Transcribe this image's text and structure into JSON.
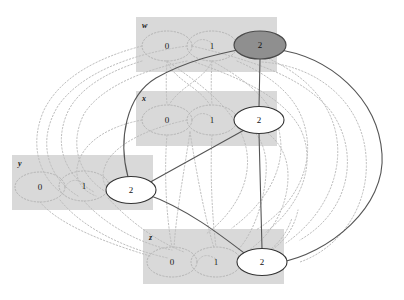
{
  "figure": {
    "type": "constraint-graph",
    "background": "#ffffff",
    "width": 404,
    "height": 300,
    "group_box_color": "#d9d9d9",
    "dotted_edge_color": "#b9b9b9",
    "solid_edge_color": "#555555",
    "node_fill": "#ffffff",
    "node_stroke": "#333333",
    "highlight_fill": "#8f8f8f",
    "highlight_stroke": "#4a4a4a"
  },
  "groups": [
    {
      "name": "w",
      "label": "w",
      "label_pos": {
        "x": 142,
        "y": 22
      },
      "box": {
        "x": 136,
        "y": 17,
        "w": 141,
        "h": 55
      },
      "values": [
        {
          "label": "0",
          "x": 167,
          "y": 46,
          "style": "dotted"
        },
        {
          "label": "1",
          "x": 212,
          "y": 46,
          "style": "dotted"
        },
        {
          "label": "2",
          "x": 260,
          "y": 45,
          "style": "solid",
          "highlighted": true
        }
      ]
    },
    {
      "name": "x",
      "label": "x",
      "label_pos": {
        "x": 142,
        "y": 95
      },
      "box": {
        "x": 136,
        "y": 91,
        "w": 141,
        "h": 55
      },
      "values": [
        {
          "label": "0",
          "x": 167,
          "y": 120,
          "style": "dotted"
        },
        {
          "label": "1",
          "x": 212,
          "y": 120,
          "style": "dotted"
        },
        {
          "label": "2",
          "x": 259,
          "y": 120,
          "style": "solid",
          "highlighted": false
        }
      ]
    },
    {
      "name": "y",
      "label": "y",
      "label_pos": {
        "x": 18,
        "y": 160
      },
      "box": {
        "x": 12,
        "y": 155,
        "w": 141,
        "h": 55
      },
      "values": [
        {
          "label": "0",
          "x": 40,
          "y": 187,
          "style": "dotted"
        },
        {
          "label": "1",
          "x": 84,
          "y": 186,
          "style": "dotted"
        },
        {
          "label": "2",
          "x": 131,
          "y": 190,
          "style": "solid",
          "highlighted": false
        }
      ]
    },
    {
      "name": "z",
      "label": "z",
      "label_pos": {
        "x": 149,
        "y": 234
      },
      "box": {
        "x": 143,
        "y": 229,
        "w": 141,
        "h": 55
      },
      "values": [
        {
          "label": "0",
          "x": 172,
          "y": 262,
          "style": "dotted"
        },
        {
          "label": "1",
          "x": 216,
          "y": 262,
          "style": "dotted"
        },
        {
          "label": "2",
          "x": 262,
          "y": 262,
          "style": "solid",
          "highlighted": false
        }
      ]
    }
  ],
  "solid_edges": [
    {
      "from": "w.2",
      "to": "x.2",
      "kind": "straight"
    },
    {
      "from": "x.2",
      "to": "z.2",
      "kind": "straight"
    },
    {
      "from": "x.2",
      "to": "y.2",
      "kind": "straight"
    },
    {
      "from": "y.2",
      "to": "w.2",
      "kind": "curve-left"
    },
    {
      "from": "y.2",
      "to": "z.2",
      "kind": "curve"
    },
    {
      "from": "y.2",
      "to": "x.2",
      "kind": "straight"
    },
    {
      "from": "w.2",
      "to": "z.2",
      "kind": "curve-right-sweep"
    }
  ],
  "dotted_edges_note": "dense web of dotted arcs linking the 0 and 1 value nodes across all four groups",
  "counts": {
    "groups": 4,
    "values_per_group": 3,
    "solid_nodes": 4,
    "highlighted_nodes": 1
  }
}
